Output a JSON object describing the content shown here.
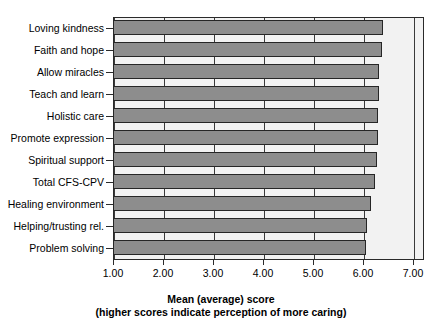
{
  "chart_data": {
    "type": "bar",
    "orientation": "horizontal",
    "title": "",
    "xlabel": "Mean (average) score",
    "xlabel_sub": "(higher scores indicate perception of more caring)",
    "ylabel": "",
    "xlim": [
      1.0,
      7.2
    ],
    "xticks": [
      1.0,
      2.0,
      3.0,
      4.0,
      5.0,
      6.0,
      7.0
    ],
    "xtick_labels": [
      "1.00",
      "2.00",
      "3.00",
      "4.00",
      "5.00",
      "6.00",
      "7.00"
    ],
    "grid": true,
    "grid_axis": "x",
    "legend": false,
    "categories": [
      "Loving kindness",
      "Faith and hope",
      "Allow miracles",
      "Teach and learn",
      "Holistic care",
      "Promote expression",
      "Spiritual support",
      "Total CFS-CPV",
      "Healing environment",
      "Helping/trusting rel.",
      "Problem solving"
    ],
    "values": [
      6.4,
      6.38,
      6.32,
      6.32,
      6.3,
      6.3,
      6.28,
      6.24,
      6.16,
      6.08,
      6.06
    ],
    "bar_color": "#8d8d8d",
    "bar_edge_color": "#262626",
    "plot_background": "#f2f2f2",
    "axis_color": "#2a2a2a"
  }
}
